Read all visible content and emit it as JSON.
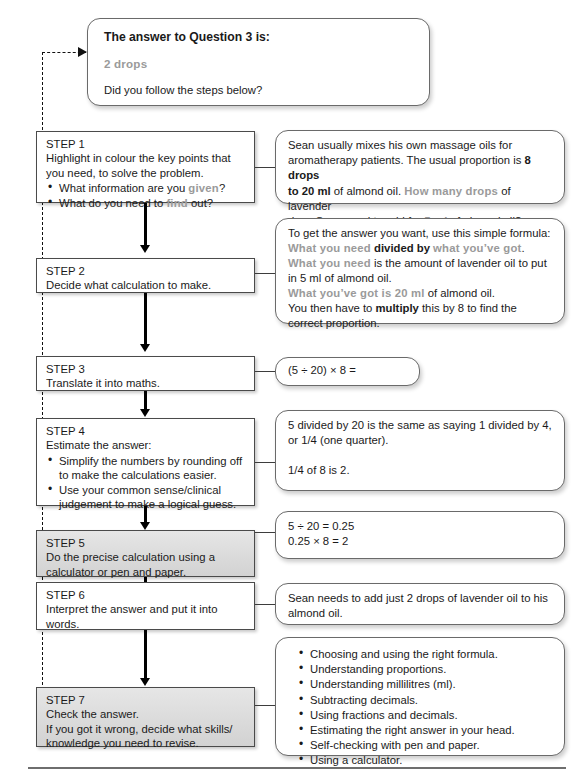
{
  "answer_box": {
    "heading": "The answer to Question 3 is:",
    "answer": "2 drops",
    "followup": "Did you follow the steps below?"
  },
  "steps": [
    {
      "id": "step-1",
      "label": "STEP 1",
      "line1": "Highlight in colour the key points that",
      "line2": "you need, to solve the problem.",
      "bullets_pre": [
        "What information are you ",
        "What do you need to "
      ],
      "bullet1_hl": "given",
      "bullet1_post": "?",
      "bullet2_hl": "find",
      "bullet2_post": " out?",
      "style": "white"
    },
    {
      "id": "step-2",
      "label": "STEP 2",
      "text": "Decide what calculation to make.",
      "style": "white"
    },
    {
      "id": "step-3",
      "label": "STEP 3",
      "text": "Translate it into maths.",
      "style": "white"
    },
    {
      "id": "step-4",
      "label": "STEP 4",
      "text": "Estimate the answer:",
      "bullets": [
        "Simplify the numbers by rounding off to make the calculations easier.",
        "Use your common sense/clinical judgement to make a logical guess."
      ],
      "style": "white"
    },
    {
      "id": "step-5",
      "label": "STEP 5",
      "line1": "Do the precise calculation using a",
      "line2": "calculator or pen and paper.",
      "style": "gray"
    },
    {
      "id": "step-6",
      "label": "STEP 6",
      "line1": "Interpret the answer and put it into",
      "line2": "words.",
      "style": "white"
    },
    {
      "id": "step-7",
      "label": "STEP 7",
      "line1": "Check the answer.",
      "line2": "If you got it wrong, decide what skills/",
      "line3": "knowledge you need to revise.",
      "style": "gray"
    }
  ],
  "notes": {
    "note1": {
      "t1": "Sean usually mixes his own massage oils for",
      "t2": "aromatherapy patients. The usual proportion is ",
      "b1": "8 drops",
      "b2": "to 20 ml",
      "t3": " of almond oil. ",
      "hl1": "How many drops",
      "t4": " of lavender",
      "t5": "does Sean need to add for ",
      "hl2": "5 ml",
      "t6": " of almond oil?"
    },
    "note2": {
      "t1": "To get the answer you want, use this simple formula:",
      "hl1": "What you need",
      "b1": "divided by",
      "hl2": "what you’ve got",
      "p1": ".",
      "hl3": "What you need",
      "t2": " is the amount of lavender oil to put",
      "t3": "in 5 ml of almond oil.",
      "hl4": "What you’ve got is 20 ml",
      "t4": " of almond oil.",
      "t5": "You then have to ",
      "b2": "multiply",
      "t6": " this by 8 to find the",
      "t7": "correct proportion."
    },
    "note3": {
      "formula": "(5 ÷ 20) × 8 ="
    },
    "note4": {
      "t1": "5 divided by 20 is the same as saying 1 divided by 4,",
      "t2": "or 1/4 (one quarter).",
      "t3": "1/4 of 8 is 2."
    },
    "note5": {
      "l1": "5 ÷ 20 = 0.25",
      "l2": "0.25 × 8 = 2"
    },
    "note6": {
      "t1": "Sean needs to add just 2 drops of lavender oil to his",
      "t2": "almond oil."
    },
    "note7": {
      "bullets": [
        "Choosing and using the right formula.",
        "Understanding proportions.",
        "Understanding millilitres (ml).",
        "Subtracting decimals.",
        "Using fractions and decimals.",
        "Estimating the right answer in your head.",
        "Self-checking with pen and paper.",
        "Using a calculator."
      ]
    }
  },
  "colors": {
    "highlight": "#9a9a9a",
    "border": "#4a4a4a",
    "connector": "#000000"
  }
}
